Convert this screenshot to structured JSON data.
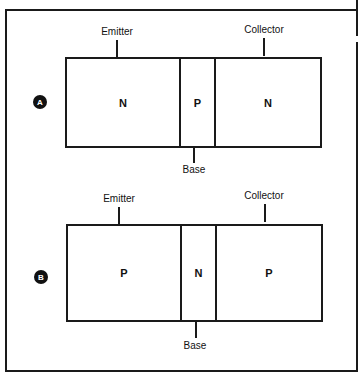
{
  "diagrams": [
    {
      "id_label": "A",
      "top_label_left": "Emitter",
      "top_label_right": "Collector",
      "bottom_label": "Base",
      "regions": [
        "N",
        "P",
        "N"
      ]
    },
    {
      "id_label": "B",
      "top_label_left": "Emitter",
      "top_label_right": "Collector",
      "bottom_label": "Base",
      "regions": [
        "P",
        "N",
        "P"
      ]
    }
  ]
}
